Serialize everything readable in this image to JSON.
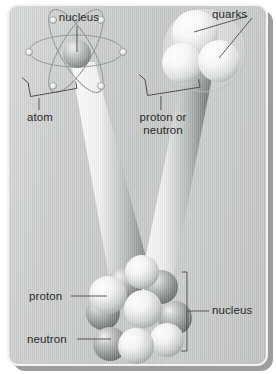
{
  "figure": {
    "width": 276,
    "height": 374,
    "background_color": "#c9cbca",
    "frame_border_color": "#f2f3f2",
    "shadow_color": "#9b9e9d",
    "label_color": "#2a2a2a",
    "leader_line_color": "#3a3a3a"
  },
  "labels": {
    "nucleus_top": "nucleus",
    "quarks": "quarks",
    "atom": "atom",
    "proton_or_neutron_line1": "proton or",
    "proton_or_neutron_line2": "neutron",
    "proton": "proton",
    "neutron": "neutron",
    "nucleus_bottom": "nucleus"
  },
  "panels": {
    "atom_panel": {
      "name": "atom",
      "label": "atom",
      "nucleus_label": "nucleus",
      "electron_count": 6,
      "orbit_count": 3,
      "nucleus_color": "#b9bbba"
    },
    "nucleon_panel": {
      "name": "proton or neutron",
      "label_line1": "proton or",
      "label_line2": "neutron",
      "quarks_label": "quarks",
      "quark_count": 3,
      "quark_color": "#f6f7f6"
    },
    "nucleus_panel": {
      "name": "nucleus",
      "label": "nucleus",
      "proton_label": "proton",
      "neutron_label": "neutron",
      "nucleon_count": 10,
      "proton_color": "#f4f5f4",
      "neutron_color": "#9fa3a2"
    }
  },
  "beams": {
    "left_beam_name": "magnification-beam-left",
    "right_beam_name": "magnification-beam-right",
    "highlight_color": "#fbfcfb",
    "shade_color": "#6f7372"
  }
}
